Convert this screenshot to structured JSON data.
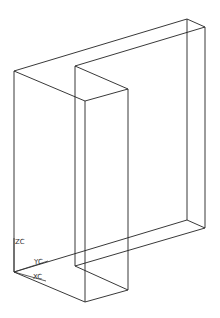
{
  "viewport": {
    "width": 220,
    "height": 318,
    "background": "#ffffff"
  },
  "model": {
    "type": "wireframe-solid",
    "edge_color": "#222222",
    "vertices": {
      "A": [
        14,
        71
      ],
      "A2": [
        14,
        272
      ],
      "B": [
        187,
        19
      ],
      "B2": [
        187,
        220
      ],
      "C": [
        205,
        27
      ],
      "C2": [
        205,
        228
      ],
      "D": [
        75,
        66
      ],
      "D2": [
        75,
        266
      ],
      "E": [
        128,
        89
      ],
      "E2": [
        128,
        290
      ],
      "F": [
        85,
        101
      ],
      "F2": [
        85,
        302
      ],
      "G": [
        75,
        97
      ]
    }
  },
  "axes": {
    "origin": [
      14,
      272
    ],
    "labels": {
      "z": "ZC",
      "y": "YC",
      "x": "XC"
    }
  }
}
